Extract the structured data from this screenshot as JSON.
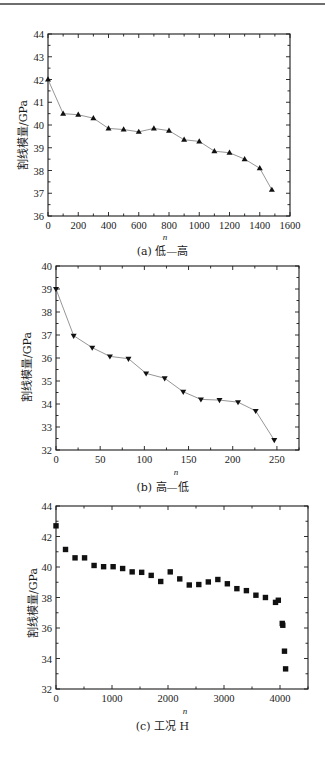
{
  "chart_data": [
    {
      "id": "a",
      "type": "line",
      "caption": "(a) 低—高",
      "xlabel": "n",
      "ylabel": "割线模量/GPa",
      "xlim": [
        0,
        1600
      ],
      "ylim": [
        36,
        44
      ],
      "xticks": [
        0,
        200,
        400,
        600,
        800,
        1000,
        1200,
        1400,
        1600
      ],
      "yticks": [
        36,
        37,
        38,
        39,
        40,
        41,
        42,
        43,
        44
      ],
      "marker": "triangle-up",
      "connected": true,
      "grid": false,
      "x": [
        0,
        100,
        200,
        300,
        400,
        500,
        600,
        700,
        800,
        900,
        1000,
        1100,
        1200,
        1300,
        1400,
        1480
      ],
      "values": [
        42.0,
        40.5,
        40.45,
        40.3,
        39.85,
        39.8,
        39.7,
        39.85,
        39.75,
        39.35,
        39.28,
        38.85,
        38.78,
        38.5,
        38.1,
        37.15
      ]
    },
    {
      "id": "b",
      "type": "line",
      "caption": "(b) 高—低",
      "xlabel": "n",
      "ylabel": "割线模量/GPa",
      "xlim": [
        0,
        275
      ],
      "ylim": [
        32,
        40
      ],
      "xticks": [
        0,
        50,
        100,
        150,
        200,
        250
      ],
      "yticks": [
        32,
        33,
        34,
        35,
        36,
        37,
        38,
        39,
        40
      ],
      "marker": "triangle-down",
      "connected": true,
      "grid": false,
      "x": [
        0,
        20,
        41,
        61,
        82,
        102,
        123,
        144,
        164,
        185,
        206,
        226,
        247
      ],
      "values": [
        39.0,
        36.97,
        36.45,
        36.07,
        35.97,
        35.33,
        35.12,
        34.53,
        34.2,
        34.17,
        34.08,
        33.7,
        32.43
      ]
    },
    {
      "id": "c",
      "type": "scatter",
      "caption": "(c) 工况 H",
      "xlabel": "n",
      "ylabel": "割线模量/GPa",
      "xlim": [
        0,
        4500
      ],
      "ylim": [
        32,
        44
      ],
      "xticks": [
        0,
        1000,
        2000,
        3000,
        4000
      ],
      "yticks": [
        32,
        34,
        36,
        38,
        40,
        42,
        44
      ],
      "marker": "square",
      "connected": false,
      "grid": false,
      "x": [
        0,
        170,
        340,
        510,
        680,
        850,
        1020,
        1190,
        1360,
        1530,
        1700,
        1870,
        2040,
        2210,
        2380,
        2550,
        2720,
        2890,
        3060,
        3230,
        3400,
        3570,
        3740,
        3920,
        3970,
        4040,
        4050,
        4080,
        4100
      ],
      "values": [
        42.7,
        41.15,
        40.6,
        40.6,
        40.1,
        40.02,
        40.02,
        39.9,
        39.68,
        39.65,
        39.45,
        39.05,
        39.68,
        39.22,
        38.82,
        38.85,
        39.02,
        39.18,
        38.9,
        38.58,
        38.45,
        38.15,
        38.0,
        37.68,
        37.82,
        36.3,
        36.18,
        34.48,
        33.32
      ]
    }
  ],
  "layout": {
    "plots": [
      {
        "left": 48,
        "top": 34,
        "right": 290,
        "bottom": 216
      },
      {
        "left": 56,
        "top": 266,
        "right": 299,
        "bottom": 450
      },
      {
        "left": 56,
        "top": 506,
        "right": 308,
        "bottom": 689
      }
    ]
  },
  "colors": {
    "axis": "#1a1a1a",
    "line": "#8a8a8a",
    "marker": "#111111",
    "rule": "#6e6e6e"
  }
}
